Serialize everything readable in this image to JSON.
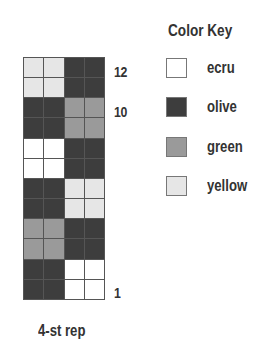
{
  "chart_data": {
    "type": "table",
    "repeat_label": "4-st rep",
    "columns": 4,
    "rows": 12,
    "row_labels": [
      {
        "row": 12,
        "label": "12"
      },
      {
        "row": 10,
        "label": "10"
      },
      {
        "row": 1,
        "label": "1"
      }
    ],
    "grid_top_to_bottom": [
      [
        "yellow",
        "yellow",
        "olive",
        "olive"
      ],
      [
        "yellow",
        "yellow",
        "olive",
        "olive"
      ],
      [
        "olive",
        "olive",
        "green",
        "green"
      ],
      [
        "olive",
        "olive",
        "green",
        "green"
      ],
      [
        "ecru",
        "ecru",
        "olive",
        "olive"
      ],
      [
        "ecru",
        "ecru",
        "olive",
        "olive"
      ],
      [
        "olive",
        "olive",
        "yellow",
        "yellow"
      ],
      [
        "olive",
        "olive",
        "yellow",
        "yellow"
      ],
      [
        "green",
        "green",
        "olive",
        "olive"
      ],
      [
        "green",
        "green",
        "olive",
        "olive"
      ],
      [
        "olive",
        "olive",
        "ecru",
        "ecru"
      ],
      [
        "olive",
        "olive",
        "ecru",
        "ecru"
      ]
    ],
    "legend": [
      {
        "name": "ecru",
        "color": "#ffffff"
      },
      {
        "name": "olive",
        "color": "#3d3d3d"
      },
      {
        "name": "green",
        "color": "#9a9a9a"
      },
      {
        "name": "yellow",
        "color": "#e6e6e6"
      }
    ]
  },
  "chart": {
    "row_labels": {
      "r12": "12",
      "r10": "10",
      "r1": "1"
    },
    "repeat_label": "4-st rep"
  },
  "key": {
    "title": "Color Key",
    "items": [
      {
        "label": "ecru",
        "color": "#ffffff"
      },
      {
        "label": "olive",
        "color": "#3d3d3d"
      },
      {
        "label": "green",
        "color": "#9a9a9a"
      },
      {
        "label": "yellow",
        "color": "#e6e6e6"
      }
    ]
  }
}
